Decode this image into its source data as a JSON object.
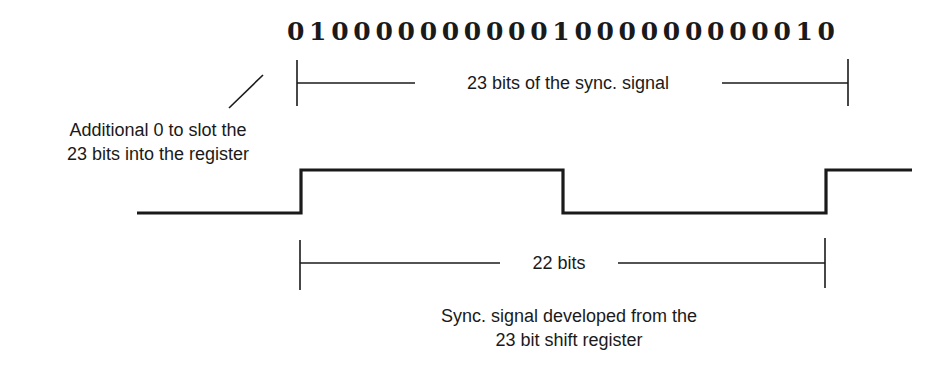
{
  "bit_sequence": {
    "bits": [
      "0",
      "1",
      "0",
      "0",
      "0",
      "0",
      "0",
      "0",
      "0",
      "0",
      "0",
      "0",
      "1",
      "0",
      "0",
      "0",
      "0",
      "0",
      "0",
      "0",
      "0",
      "0",
      "0",
      "1",
      "0"
    ],
    "display": "0 1 0 0 0 0 0 0 0 0 0 0 1 0 0 0 0 0 0 0 0 0 0 1 0"
  },
  "dimension_top": {
    "label": "23 bits of the sync. signal",
    "x_start": 297,
    "x_end": 848,
    "y": 83
  },
  "annotation_left": {
    "line1": "Additional 0 to slot the",
    "line2": "23 bits into the register"
  },
  "waveform": {
    "low_y": 213,
    "high_y": 170,
    "points": [
      [
        137,
        213
      ],
      [
        301,
        213
      ],
      [
        301,
        170
      ],
      [
        563,
        170
      ],
      [
        563,
        213
      ],
      [
        826,
        213
      ],
      [
        826,
        170
      ],
      [
        912,
        170
      ]
    ]
  },
  "dimension_bottom": {
    "label": "22 bits",
    "x_start": 300,
    "x_end": 825,
    "y": 263
  },
  "caption": {
    "line1": "Sync. signal developed from the",
    "line2": "23 bit shift register"
  },
  "colors": {
    "ink": "#1a1a1a",
    "background": "#ffffff"
  }
}
